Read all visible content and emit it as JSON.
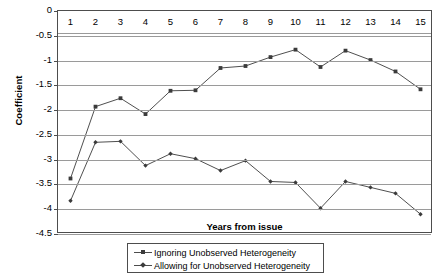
{
  "chart_data": {
    "type": "line",
    "title": "",
    "xlabel": "Years from issue",
    "ylabel": "Coefficient",
    "x": [
      1,
      2,
      3,
      4,
      5,
      6,
      7,
      8,
      9,
      10,
      11,
      12,
      13,
      14,
      15
    ],
    "xticklabels": [
      "1",
      "2",
      "3",
      "4",
      "5",
      "6",
      "7",
      "8",
      "9",
      "10",
      "11",
      "12",
      "13",
      "14",
      "15"
    ],
    "yticklabels": [
      "0",
      "-0.5",
      "-1",
      "-1.5",
      "-2",
      "-2.5",
      "-3",
      "-3.5",
      "-4",
      "-4.5"
    ],
    "ylim": [
      -4.5,
      0
    ],
    "xlim": [
      0.5,
      15.5
    ],
    "grid": "horizontal",
    "legend_position": "bottom-outside",
    "series": [
      {
        "name": "Ignoring Unobserved Heterogeneity",
        "marker": "square",
        "color": "#3b3b3b",
        "values": [
          -3.38,
          -1.93,
          -1.76,
          -2.08,
          -1.61,
          -1.6,
          -1.15,
          -1.11,
          -0.93,
          -0.78,
          -1.13,
          -0.8,
          -0.99,
          -1.22,
          -1.58
        ]
      },
      {
        "name": "Allowing for Unobserved Heterogeneity",
        "marker": "diamond",
        "color": "#3b3b3b",
        "values": [
          -3.83,
          -2.65,
          -2.63,
          -3.12,
          -2.88,
          -2.98,
          -3.22,
          -3.02,
          -3.44,
          -3.46,
          -3.98,
          -3.44,
          -3.56,
          -3.68,
          -4.1
        ]
      }
    ]
  },
  "legend": {
    "entries": [
      "Ignoring Unobserved Heterogeneity",
      "Allowing for Unobserved Heterogeneity"
    ]
  }
}
